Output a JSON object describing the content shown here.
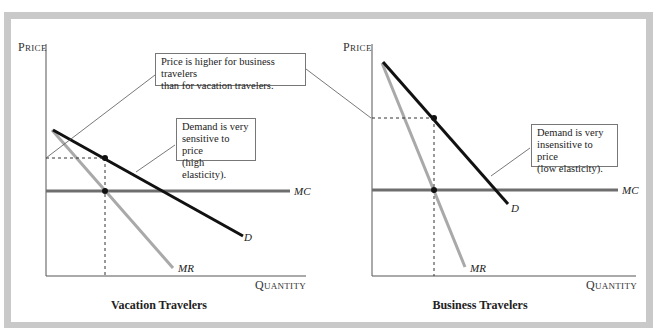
{
  "figure": {
    "left_panel": {
      "title": "Vacation Travelers",
      "y_axis_label": "Price",
      "x_axis_label": "Quantity",
      "curves": {
        "demand": "D",
        "marginal_revenue": "MR",
        "marginal_cost": "MC"
      },
      "annotation": "Demand is very sensitive to price (high elasticity).",
      "annotation_lines": [
        "Demand is very",
        "sensitive to price",
        "(high elasticity)."
      ]
    },
    "right_panel": {
      "title": "Business Travelers",
      "y_axis_label": "Price",
      "x_axis_label": "Quantity",
      "curves": {
        "demand": "D",
        "marginal_revenue": "MR",
        "marginal_cost": "MC"
      },
      "annotation": "Demand is very insensitive to price (low elasticity).",
      "annotation_lines": [
        "Demand is very",
        "insensitive to price",
        "(low elasticity)."
      ]
    },
    "shared_annotation": "Price is higher for business travelers than for vacation travelers.",
    "shared_annotation_lines": [
      "Price is higher for business travelers",
      "than for vacation travelers."
    ],
    "colors": {
      "demand": "#111111",
      "marginal_revenue": "#a9a9a9",
      "marginal_cost": "#6e6e6e",
      "frame": "#c9c9c9"
    }
  }
}
